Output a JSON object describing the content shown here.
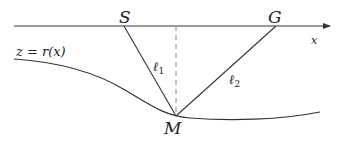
{
  "diagram": {
    "labels": {
      "source": "S",
      "receiver": "G",
      "midpoint": "M",
      "axis": "x",
      "surface": "z = r(x)",
      "leg1_main": "ℓ",
      "leg1_sub": "1",
      "leg2_main": "ℓ",
      "leg2_sub": "2"
    },
    "colors": {
      "line": "#333333",
      "dashed": "#888888",
      "background": "#ffffff"
    },
    "points": {
      "S": [
        124,
        26
      ],
      "G": [
        276,
        26
      ],
      "M": [
        176,
        116
      ]
    }
  }
}
